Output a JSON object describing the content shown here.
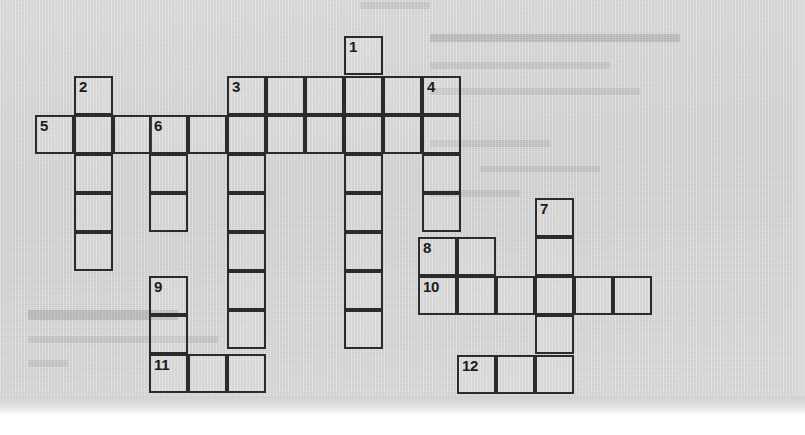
{
  "page": {
    "kind": "crossword-puzzle-grid",
    "background_color": "#d3d3d3",
    "grid_line_color": "#2b2b2b",
    "cell_size": 39,
    "width": 805,
    "height": 435
  },
  "crossword": {
    "title": "",
    "clue_numbers": [
      "1",
      "2",
      "3",
      "4",
      "5",
      "6",
      "7",
      "8",
      "9",
      "10",
      "11",
      "12"
    ],
    "cells": [
      {
        "num": "1",
        "x": 344,
        "y": 36,
        "letter": ""
      },
      {
        "num": "",
        "x": 227,
        "y": 76,
        "letter": ""
      },
      {
        "num": "3",
        "x": 227,
        "y": 76,
        "letter": ""
      },
      {
        "num": "",
        "x": 266,
        "y": 76,
        "letter": ""
      },
      {
        "num": "",
        "x": 305,
        "y": 76,
        "letter": ""
      },
      {
        "num": "",
        "x": 344,
        "y": 76,
        "letter": ""
      },
      {
        "num": "",
        "x": 383,
        "y": 76,
        "letter": ""
      },
      {
        "num": "4",
        "x": 422,
        "y": 76,
        "letter": ""
      },
      {
        "num": "2",
        "x": 74,
        "y": 76,
        "letter": ""
      },
      {
        "num": "5",
        "x": 35,
        "y": 115,
        "letter": ""
      },
      {
        "num": "",
        "x": 74,
        "y": 115,
        "letter": ""
      },
      {
        "num": "",
        "x": 113,
        "y": 115,
        "letter": ""
      },
      {
        "num": "6",
        "x": 149,
        "y": 115,
        "letter": ""
      },
      {
        "num": "",
        "x": 188,
        "y": 115,
        "letter": ""
      },
      {
        "num": "",
        "x": 227,
        "y": 115,
        "letter": ""
      },
      {
        "num": "",
        "x": 266,
        "y": 115,
        "letter": ""
      },
      {
        "num": "",
        "x": 305,
        "y": 115,
        "letter": ""
      },
      {
        "num": "",
        "x": 344,
        "y": 115,
        "letter": ""
      },
      {
        "num": "",
        "x": 383,
        "y": 115,
        "letter": ""
      },
      {
        "num": "",
        "x": 422,
        "y": 115,
        "letter": ""
      },
      {
        "num": "",
        "x": 74,
        "y": 154,
        "letter": ""
      },
      {
        "num": "",
        "x": 149,
        "y": 154,
        "letter": ""
      },
      {
        "num": "",
        "x": 227,
        "y": 154,
        "letter": ""
      },
      {
        "num": "",
        "x": 344,
        "y": 154,
        "letter": ""
      },
      {
        "num": "",
        "x": 422,
        "y": 154,
        "letter": ""
      },
      {
        "num": "",
        "x": 74,
        "y": 193,
        "letter": ""
      },
      {
        "num": "",
        "x": 149,
        "y": 193,
        "letter": ""
      },
      {
        "num": "",
        "x": 227,
        "y": 193,
        "letter": ""
      },
      {
        "num": "",
        "x": 344,
        "y": 193,
        "letter": ""
      },
      {
        "num": "",
        "x": 422,
        "y": 193,
        "letter": ""
      },
      {
        "num": "7",
        "x": 535,
        "y": 198,
        "letter": ""
      },
      {
        "num": "",
        "x": 74,
        "y": 232,
        "letter": ""
      },
      {
        "num": "",
        "x": 227,
        "y": 232,
        "letter": ""
      },
      {
        "num": "",
        "x": 344,
        "y": 232,
        "letter": ""
      },
      {
        "num": "8",
        "x": 418,
        "y": 237,
        "letter": ""
      },
      {
        "num": "",
        "x": 457,
        "y": 237,
        "letter": ""
      },
      {
        "num": "",
        "x": 535,
        "y": 237,
        "letter": ""
      },
      {
        "num": "9",
        "x": 149,
        "y": 276,
        "letter": ""
      },
      {
        "num": "",
        "x": 227,
        "y": 271,
        "letter": ""
      },
      {
        "num": "",
        "x": 344,
        "y": 271,
        "letter": ""
      },
      {
        "num": "10",
        "x": 418,
        "y": 276,
        "letter": ""
      },
      {
        "num": "",
        "x": 457,
        "y": 276,
        "letter": ""
      },
      {
        "num": "",
        "x": 496,
        "y": 276,
        "letter": ""
      },
      {
        "num": "",
        "x": 535,
        "y": 276,
        "letter": ""
      },
      {
        "num": "",
        "x": 574,
        "y": 276,
        "letter": ""
      },
      {
        "num": "",
        "x": 613,
        "y": 276,
        "letter": ""
      },
      {
        "num": "",
        "x": 149,
        "y": 315,
        "letter": ""
      },
      {
        "num": "",
        "x": 227,
        "y": 310,
        "letter": ""
      },
      {
        "num": "",
        "x": 344,
        "y": 310,
        "letter": ""
      },
      {
        "num": "",
        "x": 535,
        "y": 315,
        "letter": ""
      },
      {
        "num": "11",
        "x": 149,
        "y": 354,
        "letter": ""
      },
      {
        "num": "",
        "x": 188,
        "y": 354,
        "letter": ""
      },
      {
        "num": "",
        "x": 227,
        "y": 354,
        "letter": ""
      },
      {
        "num": "12",
        "x": 457,
        "y": 355,
        "letter": ""
      },
      {
        "num": "",
        "x": 496,
        "y": 355,
        "letter": ""
      },
      {
        "num": "",
        "x": 535,
        "y": 355,
        "letter": ""
      }
    ]
  },
  "bleed_through": {
    "note": "faint mirrored text showing through from the reverse side of the page",
    "marks": [
      {
        "x": 360,
        "y": 2,
        "w": 70,
        "h": 7
      },
      {
        "x": 430,
        "y": 34,
        "w": 250,
        "h": 8,
        "dark": true
      },
      {
        "x": 430,
        "y": 62,
        "w": 180,
        "h": 7
      },
      {
        "x": 430,
        "y": 88,
        "w": 210,
        "h": 7
      },
      {
        "x": 430,
        "y": 140,
        "w": 120,
        "h": 7
      },
      {
        "x": 480,
        "y": 166,
        "w": 120,
        "h": 6
      },
      {
        "x": 430,
        "y": 190,
        "w": 90,
        "h": 7
      },
      {
        "x": 28,
        "y": 310,
        "w": 150,
        "h": 10,
        "dark": true
      },
      {
        "x": 28,
        "y": 336,
        "w": 190,
        "h": 7
      },
      {
        "x": 28,
        "y": 360,
        "w": 40,
        "h": 7
      }
    ]
  }
}
